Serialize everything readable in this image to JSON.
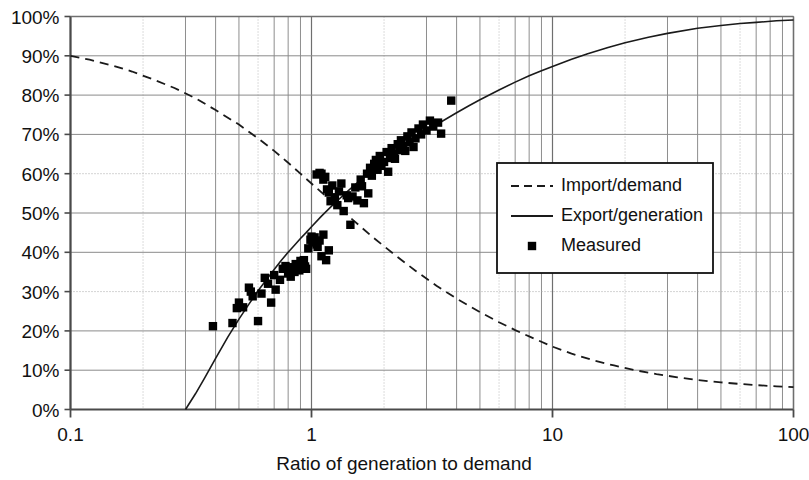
{
  "chart_data": {
    "type": "scatter",
    "title": "",
    "xlabel": "Ratio of generation to demand",
    "ylabel": "",
    "xscale": "log",
    "xlim": [
      0.1,
      100
    ],
    "ylim": [
      0,
      1
    ],
    "grid": true,
    "legend_position": "center-right",
    "xticks": [
      "0.1",
      "1",
      "10",
      "100"
    ],
    "xtick_values": [
      0.1,
      1,
      10,
      100
    ],
    "yticks": [
      "0%",
      "10%",
      "20%",
      "30%",
      "40%",
      "50%",
      "60%",
      "70%",
      "80%",
      "90%",
      "100%"
    ],
    "ytick_values": [
      0,
      10,
      20,
      30,
      40,
      50,
      60,
      70,
      80,
      90,
      100
    ],
    "series": [
      {
        "name": "Import/demand",
        "type": "line",
        "style": "dashed",
        "color": "#1a1a1a",
        "points": [
          [
            0.1,
            90.0
          ],
          [
            0.12,
            89.0
          ],
          [
            0.15,
            87.5
          ],
          [
            0.18,
            86.0
          ],
          [
            0.22,
            84.0
          ],
          [
            0.27,
            81.8
          ],
          [
            0.33,
            79.2
          ],
          [
            0.4,
            76.2
          ],
          [
            0.5,
            72.5
          ],
          [
            0.6,
            69.0
          ],
          [
            0.7,
            65.8
          ],
          [
            0.8,
            62.8
          ],
          [
            0.9,
            60.0
          ],
          [
            1.0,
            57.5
          ],
          [
            1.2,
            53.2
          ],
          [
            1.5,
            48.0
          ],
          [
            1.8,
            43.8
          ],
          [
            2.2,
            39.5
          ],
          [
            2.7,
            35.3
          ],
          [
            3.3,
            31.5
          ],
          [
            4.0,
            28.2
          ],
          [
            5.0,
            24.8
          ],
          [
            6.0,
            22.2
          ],
          [
            7.0,
            20.2
          ],
          [
            8.0,
            18.6
          ],
          [
            10.0,
            16.0
          ],
          [
            12.0,
            14.2
          ],
          [
            15.0,
            12.4
          ],
          [
            18.0,
            11.2
          ],
          [
            22.0,
            10.0
          ],
          [
            27.0,
            9.0
          ],
          [
            33.0,
            8.2
          ],
          [
            40.0,
            7.5
          ],
          [
            50.0,
            6.9
          ],
          [
            60.0,
            6.5
          ],
          [
            70.0,
            6.2
          ],
          [
            85.0,
            5.9
          ],
          [
            100.0,
            5.7
          ]
        ]
      },
      {
        "name": "Export/generation",
        "type": "line",
        "style": "solid",
        "color": "#1a1a1a",
        "points": [
          [
            0.3,
            0.0
          ],
          [
            0.33,
            4.0
          ],
          [
            0.36,
            8.0
          ],
          [
            0.4,
            13.0
          ],
          [
            0.45,
            18.5
          ],
          [
            0.5,
            23.0
          ],
          [
            0.55,
            26.8
          ],
          [
            0.6,
            30.2
          ],
          [
            0.65,
            33.0
          ],
          [
            0.7,
            35.6
          ],
          [
            0.75,
            38.0
          ],
          [
            0.8,
            40.0
          ],
          [
            0.85,
            41.8
          ],
          [
            0.9,
            43.5
          ],
          [
            0.95,
            45.0
          ],
          [
            1.0,
            46.5
          ],
          [
            1.1,
            49.2
          ],
          [
            1.2,
            51.5
          ],
          [
            1.3,
            53.5
          ],
          [
            1.4,
            55.3
          ],
          [
            1.5,
            57.0
          ],
          [
            1.7,
            59.8
          ],
          [
            1.9,
            62.2
          ],
          [
            2.1,
            64.2
          ],
          [
            2.4,
            66.8
          ],
          [
            2.7,
            69.0
          ],
          [
            3.0,
            70.8
          ],
          [
            3.5,
            73.4
          ],
          [
            4.0,
            75.5
          ],
          [
            4.5,
            77.3
          ],
          [
            5.0,
            78.8
          ],
          [
            6.0,
            81.3
          ],
          [
            7.0,
            83.3
          ],
          [
            8.0,
            84.9
          ],
          [
            9.0,
            86.2
          ],
          [
            10.0,
            87.3
          ],
          [
            12.0,
            89.1
          ],
          [
            14.0,
            90.5
          ],
          [
            17.0,
            92.1
          ],
          [
            20.0,
            93.3
          ],
          [
            25.0,
            94.7
          ],
          [
            30.0,
            95.7
          ],
          [
            40.0,
            97.0
          ],
          [
            50.0,
            97.7
          ],
          [
            60.0,
            98.2
          ],
          [
            70.0,
            98.5
          ],
          [
            85.0,
            98.9
          ],
          [
            100.0,
            99.1
          ]
        ]
      },
      {
        "name": "Measured",
        "type": "scatter",
        "marker": "square",
        "color": "#000000",
        "points": [
          [
            0.39,
            21.2
          ],
          [
            0.47,
            22.0
          ],
          [
            0.49,
            25.8
          ],
          [
            0.5,
            27.2
          ],
          [
            0.52,
            26.0
          ],
          [
            0.55,
            31.0
          ],
          [
            0.56,
            30.0
          ],
          [
            0.57,
            28.8
          ],
          [
            0.6,
            22.5
          ],
          [
            0.62,
            29.5
          ],
          [
            0.64,
            33.5
          ],
          [
            0.66,
            32.0
          ],
          [
            0.68,
            27.2
          ],
          [
            0.7,
            34.2
          ],
          [
            0.71,
            30.5
          ],
          [
            0.74,
            33.0
          ],
          [
            0.76,
            35.8
          ],
          [
            0.78,
            36.5
          ],
          [
            0.8,
            34.6
          ],
          [
            0.82,
            33.8
          ],
          [
            0.84,
            36.2
          ],
          [
            0.85,
            35.0
          ],
          [
            0.86,
            37.0
          ],
          [
            0.88,
            36.0
          ],
          [
            0.89,
            35.4
          ],
          [
            0.9,
            37.8
          ],
          [
            0.91,
            36.6
          ],
          [
            0.93,
            38.0
          ],
          [
            0.94,
            36.4
          ],
          [
            0.95,
            35.8
          ],
          [
            0.97,
            41.0
          ],
          [
            0.99,
            43.2
          ],
          [
            1.0,
            44.0
          ],
          [
            1.01,
            42.5
          ],
          [
            1.03,
            43.8
          ],
          [
            1.05,
            42.0
          ],
          [
            1.06,
            41.4
          ],
          [
            1.08,
            43.0
          ],
          [
            1.1,
            39.0
          ],
          [
            1.12,
            44.5
          ],
          [
            1.15,
            38.0
          ],
          [
            1.18,
            40.5
          ],
          [
            1.05,
            59.8
          ],
          [
            1.08,
            60.2
          ],
          [
            1.1,
            60.0
          ],
          [
            1.12,
            58.5
          ],
          [
            1.14,
            59.2
          ],
          [
            1.16,
            56.0
          ],
          [
            1.18,
            55.2
          ],
          [
            1.2,
            53.0
          ],
          [
            1.22,
            57.0
          ],
          [
            1.25,
            54.0
          ],
          [
            1.28,
            52.0
          ],
          [
            1.3,
            55.5
          ],
          [
            1.33,
            57.5
          ],
          [
            1.36,
            50.5
          ],
          [
            1.4,
            54.5
          ],
          [
            1.42,
            53.8
          ],
          [
            1.45,
            47.0
          ],
          [
            1.48,
            54.2
          ],
          [
            1.52,
            56.5
          ],
          [
            1.55,
            53.2
          ],
          [
            1.6,
            58.5
          ],
          [
            1.62,
            56.8
          ],
          [
            1.65,
            52.5
          ],
          [
            1.7,
            60.0
          ],
          [
            1.72,
            55.0
          ],
          [
            1.75,
            61.5
          ],
          [
            1.78,
            59.5
          ],
          [
            1.82,
            62.5
          ],
          [
            1.85,
            63.5
          ],
          [
            1.88,
            61.0
          ],
          [
            1.92,
            64.5
          ],
          [
            1.95,
            62.0
          ],
          [
            2.0,
            63.0
          ],
          [
            2.05,
            65.5
          ],
          [
            2.08,
            60.5
          ],
          [
            2.12,
            64.0
          ],
          [
            2.15,
            66.5
          ],
          [
            2.2,
            65.0
          ],
          [
            2.22,
            63.8
          ],
          [
            2.28,
            67.5
          ],
          [
            2.32,
            66.0
          ],
          [
            2.35,
            68.5
          ],
          [
            2.4,
            67.0
          ],
          [
            2.45,
            65.8
          ],
          [
            2.5,
            69.5
          ],
          [
            2.55,
            68.0
          ],
          [
            2.6,
            70.5
          ],
          [
            2.65,
            66.8
          ],
          [
            2.7,
            69.0
          ],
          [
            2.78,
            71.5
          ],
          [
            2.85,
            70.0
          ],
          [
            2.9,
            72.5
          ],
          [
            3.0,
            71.0
          ],
          [
            3.1,
            73.5
          ],
          [
            3.2,
            72.0
          ],
          [
            3.35,
            73.0
          ],
          [
            3.45,
            70.2
          ],
          [
            3.8,
            78.6
          ]
        ]
      }
    ]
  },
  "legend": {
    "items": [
      {
        "label": "Import/demand",
        "style": "dashed"
      },
      {
        "label": "Export/generation",
        "style": "solid"
      },
      {
        "label": "Measured",
        "style": "marker"
      }
    ]
  }
}
